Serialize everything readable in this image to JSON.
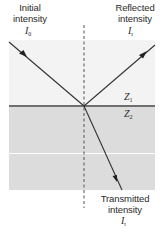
{
  "diagram": {
    "incident": {
      "label_line1": "Initial",
      "label_line2": "intensity",
      "symbol": "I",
      "subscript": "0"
    },
    "reflected": {
      "label_line1": "Reflected",
      "label_line2": "intensity",
      "symbol": "I",
      "subscript": "r"
    },
    "transmitted": {
      "label_line1": "Transmitted",
      "label_line2": "intensity",
      "symbol": "I",
      "subscript": "t"
    },
    "media": {
      "upper": {
        "symbol": "Z",
        "subscript": "1",
        "color": "#f3f3f3"
      },
      "lower": {
        "symbol": "Z",
        "subscript": "2",
        "color": "#dcdcdc"
      }
    },
    "normal_line": "dashed",
    "interface_color": "#6f6f6f",
    "ray_color": "#333333"
  }
}
